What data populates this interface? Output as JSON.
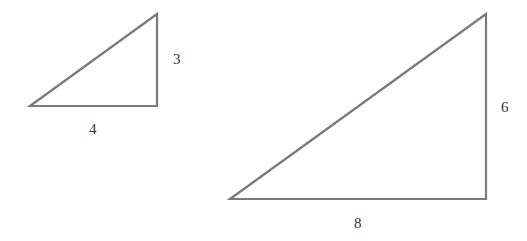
{
  "diagram": {
    "type": "similar right triangles",
    "stroke_color": "#7a7a7a",
    "triangles": [
      {
        "name": "small",
        "vertices": [
          [
            30,
            106
          ],
          [
            157,
            106
          ],
          [
            157,
            14
          ]
        ],
        "labels": {
          "vertical": "3",
          "horizontal": "4"
        }
      },
      {
        "name": "large",
        "vertices": [
          [
            230,
            199
          ],
          [
            486,
            199
          ],
          [
            486,
            14
          ]
        ],
        "labels": {
          "vertical": "6",
          "horizontal": "8"
        }
      }
    ]
  }
}
